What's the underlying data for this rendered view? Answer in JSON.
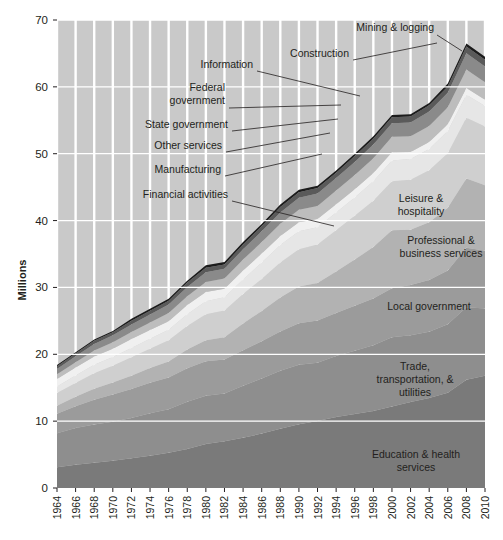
{
  "axis": {
    "y_title": "Millions",
    "y_ticks": [
      0,
      10,
      20,
      30,
      40,
      50,
      60,
      70
    ],
    "x_ticks": [
      "1964",
      "1966",
      "1968",
      "1970",
      "1972",
      "1974",
      "1976",
      "1978",
      "1980",
      "1982",
      "1984",
      "1986",
      "1988",
      "1990",
      "1992",
      "1994",
      "1996",
      "1998",
      "2000",
      "2002",
      "2004",
      "2006",
      "2008",
      "2010"
    ]
  },
  "inside_labels": [
    {
      "name": "leisure-hospitality",
      "lines": [
        "Leisure &",
        "hospitality"
      ],
      "x": 421,
      "y": 202
    },
    {
      "name": "professional-business-services",
      "lines": [
        "Professional &",
        "business services"
      ],
      "x": 441,
      "y": 244
    },
    {
      "name": "local-government",
      "lines": [
        "Local government"
      ],
      "x": 429,
      "y": 310
    },
    {
      "name": "trade-transportation-utilities",
      "lines": [
        "Trade,",
        "transportation, &",
        "utilities"
      ],
      "x": 415,
      "y": 370
    },
    {
      "name": "education-health-services",
      "lines": [
        "Education & health",
        "services"
      ],
      "x": 416,
      "y": 458
    }
  ],
  "callouts": [
    {
      "name": "mining-logging",
      "lines": [
        "Mining & logging"
      ],
      "tx": 434,
      "ty": 31,
      "path": "M437,35 L462,51"
    },
    {
      "name": "construction",
      "lines": [
        "Construction"
      ],
      "tx": 349,
      "ty": 57,
      "path": "M353,60 L437,43"
    },
    {
      "name": "information",
      "lines": [
        "Information"
      ],
      "tx": 253,
      "ty": 68,
      "path": "M257,71 L360,96"
    },
    {
      "name": "federal-government",
      "lines": [
        "Federal",
        "government"
      ],
      "tx": 225,
      "ty": 91,
      "path": "M229,108 L341,105"
    },
    {
      "name": "state-government",
      "lines": [
        "State government"
      ],
      "tx": 228,
      "ty": 128,
      "path": "M232,131 L338,119"
    },
    {
      "name": "other-services",
      "lines": [
        "Other services"
      ],
      "tx": 222,
      "ty": 149,
      "path": "M226,152 L330,133"
    },
    {
      "name": "manufacturing",
      "lines": [
        "Manufacturing"
      ],
      "tx": 221,
      "ty": 173,
      "path": "M225,176 L322,154"
    },
    {
      "name": "financial-activities",
      "lines": [
        "Financial activities"
      ],
      "tx": 228,
      "ty": 198,
      "path": "M232,201 L334,226"
    }
  ],
  "colors": {
    "background": "#c9c9c9",
    "gridline": "#ffffff",
    "bands": [
      "#7a7a7a",
      "#8e8e8e",
      "#9b9b9b",
      "#b2b2b2",
      "#cfcfcf",
      "#e6e6e6",
      "#f0f0f0",
      "#bdbdbd",
      "#8a8a8a",
      "#5a5a5a",
      "#1c1c1c"
    ]
  },
  "chart_data": {
    "type": "area",
    "title": "",
    "xlabel": "",
    "ylabel": "Millions",
    "ylim": [
      0,
      70
    ],
    "stacked": true,
    "grid": true,
    "legend_position": "in-plot",
    "x": [
      1964,
      1966,
      1968,
      1970,
      1972,
      1974,
      1976,
      1978,
      1980,
      1982,
      1984,
      1986,
      1988,
      1990,
      1992,
      1994,
      1996,
      1998,
      2000,
      2002,
      2004,
      2006,
      2008,
      2010
    ],
    "series": [
      {
        "name": "Education & health services",
        "values": [
          3.1,
          3.5,
          3.9,
          4.3,
          4.7,
          5.2,
          5.7,
          6.3,
          7.1,
          7.7,
          8.3,
          9.0,
          9.8,
          10.6,
          11.3,
          12.0,
          12.5,
          13.0,
          13.8,
          14.8,
          15.6,
          16.4,
          17.5,
          18.5
        ]
      },
      {
        "name": "Trade, transportation, & utilities",
        "values": [
          5.1,
          5.5,
          5.9,
          6.1,
          6.4,
          6.8,
          7.0,
          7.6,
          7.8,
          7.9,
          8.6,
          9.1,
          9.6,
          9.9,
          9.8,
          10.3,
          10.7,
          11.1,
          11.7,
          11.5,
          11.5,
          11.8,
          11.7,
          11.1
        ]
      },
      {
        "name": "Local government",
        "values": [
          2.9,
          3.3,
          3.8,
          4.3,
          4.6,
          4.9,
          5.1,
          5.4,
          5.6,
          5.6,
          5.9,
          6.2,
          6.5,
          6.9,
          7.1,
          7.3,
          7.6,
          7.9,
          8.3,
          8.7,
          9.0,
          9.3,
          9.6,
          9.5
        ]
      },
      {
        "name": "Professional & business services",
        "values": [
          1.2,
          1.4,
          1.7,
          1.9,
          2.1,
          2.4,
          2.6,
          3.0,
          3.4,
          3.7,
          4.4,
          5.0,
          5.6,
          6.1,
          6.3,
          7.0,
          7.8,
          8.7,
          9.8,
          9.5,
          10.0,
          10.8,
          11.2,
          10.8
        ]
      },
      {
        "name": "Leisure & hospitality",
        "values": [
          1.9,
          2.1,
          2.4,
          2.6,
          2.9,
          3.1,
          3.4,
          3.8,
          4.2,
          4.4,
          4.9,
          5.3,
          5.8,
          6.2,
          6.5,
          7.0,
          7.4,
          7.8,
          8.3,
          8.6,
          9.0,
          9.4,
          9.8,
          9.7
        ]
      },
      {
        "name": "Financial activities",
        "values": [
          1.0,
          1.1,
          1.3,
          1.4,
          1.5,
          1.6,
          1.7,
          1.9,
          2.1,
          2.2,
          2.4,
          2.7,
          2.9,
          3.0,
          2.9,
          3.0,
          3.1,
          3.3,
          3.5,
          3.6,
          3.7,
          3.8,
          3.7,
          3.4
        ]
      },
      {
        "name": "Manufacturing",
        "values": [
          1.1,
          1.2,
          1.3,
          1.3,
          1.4,
          1.4,
          1.4,
          1.5,
          1.5,
          1.4,
          1.5,
          1.5,
          1.5,
          1.5,
          1.4,
          1.4,
          1.4,
          1.4,
          1.4,
          1.2,
          1.2,
          1.2,
          1.1,
          1.0
        ]
      },
      {
        "name": "Other services",
        "values": [
          0.7,
          0.8,
          0.9,
          1.0,
          1.1,
          1.2,
          1.3,
          1.4,
          1.6,
          1.7,
          1.8,
          1.9,
          2.0,
          2.1,
          2.2,
          2.3,
          2.4,
          2.5,
          2.6,
          2.7,
          2.8,
          2.9,
          3.0,
          2.9
        ]
      },
      {
        "name": "State government",
        "values": [
          0.8,
          0.9,
          1.0,
          1.1,
          1.2,
          1.3,
          1.4,
          1.5,
          1.6,
          1.6,
          1.7,
          1.8,
          1.9,
          2.0,
          2.1,
          2.1,
          2.2,
          2.3,
          2.3,
          2.4,
          2.5,
          2.5,
          2.6,
          2.6
        ]
      },
      {
        "name": "Federal government, Information, Construction",
        "values": [
          0.4,
          0.4,
          0.5,
          0.5,
          0.6,
          0.6,
          0.6,
          0.7,
          0.7,
          0.7,
          0.8,
          0.8,
          0.9,
          0.9,
          0.9,
          0.9,
          1.0,
          1.0,
          1.0,
          1.0,
          1.1,
          1.1,
          1.1,
          1.1
        ]
      },
      {
        "name": "Mining & logging",
        "values": [
          0.2,
          0.2,
          0.2,
          0.2,
          0.3,
          0.3,
          0.3,
          0.3,
          0.4,
          0.4,
          0.4,
          0.4,
          0.4,
          0.4,
          0.4,
          0.4,
          0.4,
          0.4,
          0.4,
          0.4,
          0.4,
          0.5,
          0.5,
          0.5
        ]
      }
    ],
    "totals": [
      18.4,
      20.4,
      22.9,
      24.7,
      26.8,
      28.8,
      30.5,
      33.4,
      36.0,
      37.3,
      40.7,
      43.7,
      46.9,
      49.6,
      51.0,
      53.7,
      56.5,
      59.4,
      63.1,
      64.4,
      66.8,
      69.7,
      71.8,
      71.1
    ]
  }
}
